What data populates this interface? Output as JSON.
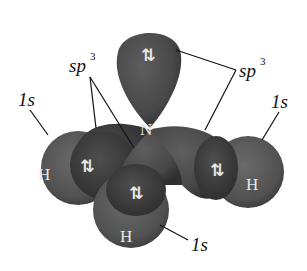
{
  "diagram": {
    "center_atom": "N",
    "hydrogen_label": "H",
    "spin_pair_symbol": "⇅",
    "labels": {
      "sp3_left": "sp",
      "sp3_left_sup": "3",
      "sp3_right": "sp",
      "sp3_right_sup": "3",
      "s_left": "1s",
      "s_right": "1s",
      "s_bottom": "1s"
    },
    "colors": {
      "lobe": "#4a4a4a",
      "lobe_dark": "#333333",
      "hydrogen": "#555555",
      "background": "#ffffff",
      "leader_line": "#111111"
    }
  }
}
